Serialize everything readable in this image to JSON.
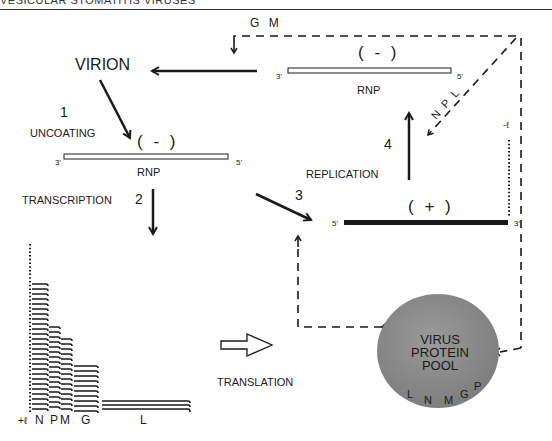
{
  "header": {
    "text": "VESICULAR STOMATITIS VIRUSES"
  },
  "labels": {
    "virion": "VIRION",
    "step1_number": "1",
    "step1_label": "UNCOATING",
    "step2_number": "2",
    "step2_label": "TRANSCRIPTION",
    "step3_number": "3",
    "step4_number": "4",
    "step4_label": "REPLICATION",
    "translation": "TRANSLATION",
    "gm": "G  M",
    "npl": "N P L",
    "minus_lead": "-ℓ",
    "plus_lead": "+ℓ"
  },
  "strands": {
    "top_negative": {
      "sense": "( - )",
      "label": "RNP",
      "end_left": "3'",
      "end_right": "5'"
    },
    "left_negative": {
      "sense": "( - )",
      "label": "RNP",
      "end_left": "3'",
      "end_right": "5'"
    },
    "positive": {
      "sense": "( + )",
      "end_left": "5'",
      "end_right": "3'"
    }
  },
  "protein_pool": {
    "line1": "VIRUS",
    "line2": "PROTEIN",
    "line3": "POOL",
    "proteins": [
      "L",
      "N",
      "M",
      "G",
      "P"
    ],
    "color": "#8a8a8a"
  },
  "transcripts": {
    "genes": [
      "N",
      "P",
      "M",
      "G",
      "L"
    ],
    "relative_abundance": [
      26,
      18,
      15,
      10,
      3
    ]
  },
  "colors": {
    "ink": "#1a1a1a",
    "pool": "#8a8a8a",
    "background": "#ffffff"
  }
}
